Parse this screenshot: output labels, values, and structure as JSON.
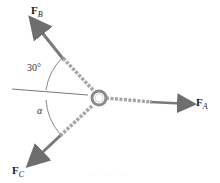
{
  "diagram": {
    "forces": [
      {
        "id": "FB",
        "symbol": "F",
        "subscript": "B"
      },
      {
        "id": "FA",
        "symbol": "F",
        "subscript": "A"
      },
      {
        "id": "FC",
        "symbol": "F",
        "subscript": "C"
      }
    ],
    "angles": {
      "top": "30°",
      "bottom": "α"
    },
    "colors": {
      "arrow": "#7a7a7a",
      "rope": "#9a9a9a",
      "ring": "#888888",
      "reference_line": "#555555"
    },
    "caption": "· · ·   · · · · ·"
  }
}
